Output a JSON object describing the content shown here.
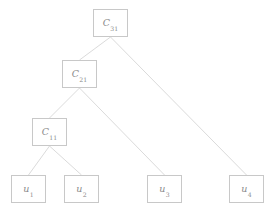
{
  "figure": {
    "kind": "hierarchical-cluster-tree",
    "background_color": "#ffffff",
    "edge_color": "#d0d0d0",
    "node_border_color": "#c8c8c8",
    "node_fill_color": "#ffffff",
    "text_color": "#8a8a8a"
  },
  "nodes": [
    {
      "id": "C31",
      "symbol": "C",
      "subscript": "31",
      "label": "C31",
      "x": 93,
      "y": 9,
      "w": 35,
      "h": 28,
      "level": 3
    },
    {
      "id": "C21",
      "symbol": "C",
      "subscript": "21",
      "label": "C21",
      "x": 62,
      "y": 60,
      "w": 35,
      "h": 28,
      "level": 2
    },
    {
      "id": "C11",
      "symbol": "C",
      "subscript": "11",
      "label": "C11",
      "x": 32,
      "y": 118,
      "w": 35,
      "h": 28,
      "level": 1
    },
    {
      "id": "u1",
      "symbol": "u",
      "subscript": "1",
      "label": "u1",
      "x": 11,
      "y": 175,
      "w": 35,
      "h": 28,
      "level": 0
    },
    {
      "id": "u2",
      "symbol": "u",
      "subscript": "2",
      "label": "u2",
      "x": 64,
      "y": 175,
      "w": 35,
      "h": 28,
      "level": 0
    },
    {
      "id": "u3",
      "symbol": "u",
      "subscript": "3",
      "label": "u3",
      "x": 147,
      "y": 175,
      "w": 35,
      "h": 28,
      "level": 0
    },
    {
      "id": "u4",
      "symbol": "u",
      "subscript": "4",
      "label": "u4",
      "x": 229,
      "y": 175,
      "w": 35,
      "h": 28,
      "level": 0
    }
  ],
  "edges": [
    {
      "from": "C31",
      "to": "C21",
      "x1": 110.5,
      "y1": 37,
      "x2": 79.5,
      "y2": 60
    },
    {
      "from": "C31",
      "to": "u4",
      "x1": 110.5,
      "y1": 37,
      "x2": 246.5,
      "y2": 175
    },
    {
      "from": "C21",
      "to": "C11",
      "x1": 79.5,
      "y1": 88,
      "x2": 49.5,
      "y2": 118
    },
    {
      "from": "C21",
      "to": "u3",
      "x1": 79.5,
      "y1": 88,
      "x2": 164.5,
      "y2": 175
    },
    {
      "from": "C11",
      "to": "u1",
      "x1": 49.5,
      "y1": 146,
      "x2": 28.5,
      "y2": 175
    },
    {
      "from": "C11",
      "to": "u2",
      "x1": 49.5,
      "y1": 146,
      "x2": 81.5,
      "y2": 175
    }
  ]
}
